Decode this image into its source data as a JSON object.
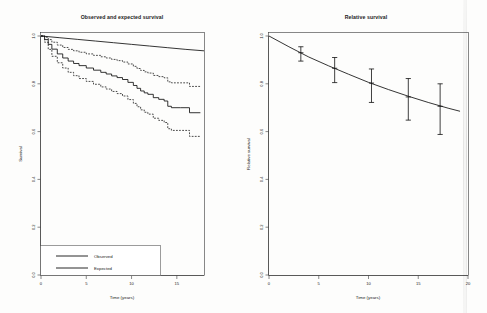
{
  "figure": {
    "background": "#fdfdfc",
    "ink_color": "#101010",
    "panels": 2
  },
  "left_panel": {
    "title": "Observed and expected survival",
    "xlabel": "Time (years)",
    "ylabel": "Survival",
    "legend": {
      "items": [
        {
          "label": "Observed",
          "style": "solid"
        },
        {
          "label": "Expected",
          "style": "solid"
        }
      ]
    }
  },
  "right_panel": {
    "title": "Relative survival",
    "xlabel": "Time (years)",
    "ylabel": "Relative survival"
  },
  "chart_data": [
    {
      "type": "line",
      "panel": "left",
      "title": "Observed and expected survival",
      "xlabel": "Time (years)",
      "ylabel": "Survival",
      "xlim": [
        0,
        18
      ],
      "ylim": [
        0.0,
        1.0
      ],
      "xticks": [
        0,
        5,
        10,
        15
      ],
      "yticks": [
        0.0,
        0.2,
        0.4,
        0.6,
        0.8,
        1.0
      ],
      "grid": false,
      "legend_position": "bottom-left",
      "series": [
        {
          "name": "Expected",
          "style": "solid",
          "x": [
            0,
            2,
            4,
            6,
            8,
            10,
            12,
            14,
            16,
            18
          ],
          "values": [
            1.0,
            0.993,
            0.986,
            0.979,
            0.972,
            0.965,
            0.958,
            0.951,
            0.944,
            0.938
          ]
        },
        {
          "name": "Observed",
          "style": "step-solid",
          "x": [
            0,
            0.4,
            0.8,
            1.2,
            1.8,
            2.4,
            3.0,
            3.6,
            4.2,
            5.0,
            5.8,
            6.6,
            7.2,
            7.8,
            8.4,
            9.0,
            9.6,
            10.2,
            10.6,
            11.0,
            11.4,
            11.8,
            12.4,
            13.0,
            13.6,
            14.0,
            14.4,
            15.4,
            16.4,
            17.6
          ],
          "values": [
            1.0,
            0.985,
            0.965,
            0.945,
            0.925,
            0.908,
            0.895,
            0.885,
            0.876,
            0.866,
            0.857,
            0.848,
            0.841,
            0.833,
            0.826,
            0.818,
            0.806,
            0.793,
            0.781,
            0.77,
            0.762,
            0.756,
            0.742,
            0.735,
            0.728,
            0.706,
            0.7,
            0.7,
            0.679,
            0.679
          ]
        },
        {
          "name": "Observed upper 95% CI",
          "style": "step-dashed",
          "x": [
            0,
            0.4,
            0.8,
            1.2,
            1.8,
            2.4,
            3.0,
            3.6,
            4.2,
            5.0,
            5.8,
            6.6,
            7.2,
            7.8,
            8.4,
            9.0,
            9.6,
            10.2,
            10.6,
            11.0,
            11.4,
            11.8,
            12.4,
            13.0,
            13.6,
            14.0,
            14.4,
            15.4,
            16.4,
            17.6
          ],
          "values": [
            1.0,
            0.995,
            0.985,
            0.974,
            0.962,
            0.952,
            0.944,
            0.938,
            0.932,
            0.925,
            0.919,
            0.913,
            0.908,
            0.902,
            0.897,
            0.891,
            0.883,
            0.873,
            0.864,
            0.856,
            0.85,
            0.845,
            0.835,
            0.83,
            0.825,
            0.808,
            0.804,
            0.804,
            0.789,
            0.789
          ]
        },
        {
          "name": "Observed lower 95% CI",
          "style": "step-dashed",
          "x": [
            0,
            0.4,
            0.8,
            1.2,
            1.8,
            2.4,
            3.0,
            3.6,
            4.2,
            5.0,
            5.8,
            6.6,
            7.2,
            7.8,
            8.4,
            9.0,
            9.6,
            10.2,
            10.6,
            11.0,
            11.4,
            11.8,
            12.4,
            13.0,
            13.6,
            14.0,
            14.4,
            15.4,
            16.4,
            17.6
          ],
          "values": [
            1.0,
            0.974,
            0.944,
            0.915,
            0.888,
            0.866,
            0.848,
            0.834,
            0.822,
            0.81,
            0.798,
            0.787,
            0.778,
            0.768,
            0.759,
            0.749,
            0.734,
            0.718,
            0.704,
            0.691,
            0.681,
            0.673,
            0.656,
            0.647,
            0.638,
            0.612,
            0.605,
            0.605,
            0.58,
            0.58
          ]
        }
      ]
    },
    {
      "type": "line",
      "panel": "right",
      "title": "Relative survival",
      "xlabel": "Time (years)",
      "ylabel": "Relative survival",
      "xlim": [
        0,
        20
      ],
      "ylim": [
        0.0,
        1.0
      ],
      "xticks": [
        0,
        5,
        10,
        15,
        20
      ],
      "yticks": [
        0.0,
        0.2,
        0.4,
        0.6,
        0.8,
        1.0
      ],
      "grid": false,
      "legend_position": "none",
      "series": [
        {
          "name": "Relative survival",
          "style": "solid",
          "x": [
            0,
            2,
            4,
            6,
            8,
            10,
            12,
            14,
            16,
            18,
            19.2
          ],
          "values": [
            1.0,
            0.955,
            0.912,
            0.875,
            0.84,
            0.806,
            0.776,
            0.748,
            0.722,
            0.698,
            0.685
          ]
        }
      ],
      "error_bars": [
        {
          "x": 3.2,
          "y": 0.93,
          "low": 0.895,
          "high": 0.955
        },
        {
          "x": 6.6,
          "y": 0.865,
          "low": 0.805,
          "high": 0.91
        },
        {
          "x": 10.3,
          "y": 0.803,
          "low": 0.722,
          "high": 0.862
        },
        {
          "x": 14.0,
          "y": 0.745,
          "low": 0.648,
          "high": 0.822
        },
        {
          "x": 17.2,
          "y": 0.706,
          "low": 0.588,
          "high": 0.8
        }
      ]
    }
  ]
}
